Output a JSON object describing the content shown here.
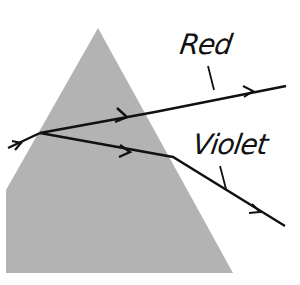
{
  "diagram": {
    "type": "prism-dispersion",
    "labels": {
      "red": "Red",
      "violet": "Violet"
    },
    "colors": {
      "prism_fill": "#b3b3b3",
      "ray": "#111111",
      "background": "#ffffff"
    },
    "prism": {
      "points": [
        [
          98,
          28
        ],
        [
          233,
          273
        ],
        [
          6,
          273
        ],
        [
          6,
          190
        ]
      ]
    },
    "rays": {
      "incident": {
        "from": [
          8,
          148
        ],
        "to": [
          40,
          133
        ]
      },
      "red_inside": {
        "from": [
          40,
          133
        ],
        "to": [
          155,
          112
        ]
      },
      "red_outside": {
        "from": [
          155,
          112
        ],
        "to": [
          286,
          86
        ]
      },
      "violet_inside": {
        "from": [
          40,
          133
        ],
        "to": [
          173,
          157
        ]
      },
      "violet_outside": {
        "from": [
          173,
          157
        ],
        "to": [
          285,
          226
        ]
      }
    }
  }
}
